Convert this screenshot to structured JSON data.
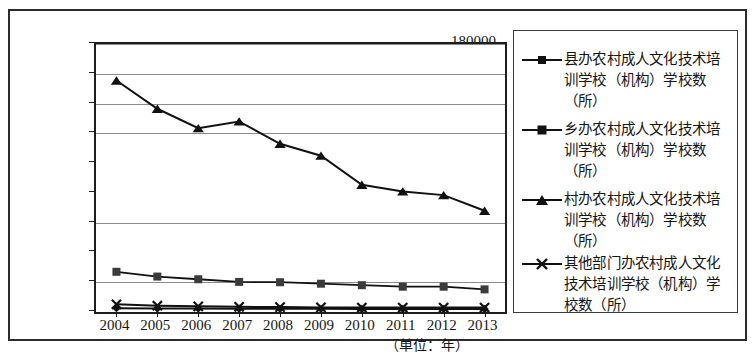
{
  "chart_data": {
    "type": "line",
    "title": "",
    "xlabel": "（单位：年）",
    "ylabel": "",
    "categories": [
      "2004",
      "2005",
      "2006",
      "2007",
      "2008",
      "2009",
      "2010",
      "2011",
      "2012",
      "2013"
    ],
    "ylim": [
      0,
      180000
    ],
    "ytick_values": [
      0,
      20000,
      40000,
      60000,
      80000,
      100000,
      120000,
      140000,
      160000,
      180000
    ],
    "ytick_labels": [
      "0",
      "20000",
      "40000",
      "60000",
      "80000",
      "100000",
      "120000",
      "140000",
      "160000",
      "180000"
    ],
    "gridline_values": [
      20000,
      60000,
      120000,
      140000,
      160000,
      180000
    ],
    "grid": true,
    "legend_position": "right",
    "series": [
      {
        "name": "县办农村成人文化技术培训学校（机构）学校数（所）",
        "marker": "diamond",
        "values": [
          null,
          null,
          null,
          null,
          null,
          null,
          null,
          null,
          null,
          null
        ]
      },
      {
        "name": "乡办农村成人文化技术培训学校（机构）学校数（所）",
        "marker": "square",
        "values": [
          27000,
          23800,
          22000,
          20200,
          20000,
          19000,
          18000,
          17000,
          17000,
          15200
        ]
      },
      {
        "name": "村办农村成人文化技术培训学校（机构）学校数（所）",
        "marker": "triangle",
        "values": [
          155500,
          136500,
          123500,
          128000,
          113000,
          105000,
          85500,
          81000,
          78500,
          68000
        ]
      },
      {
        "name": "其他部门办农村成人文化技术培训学校（机构）学校数（所）",
        "marker": "cross",
        "values": [
          5200,
          4200,
          3800,
          3500,
          3300,
          3100,
          3000,
          3000,
          3000,
          3000
        ]
      }
    ],
    "low_series_extra": {
      "name": "县办农村成人文化技术培训学校（机构）学校数（所）",
      "marker": "diamond",
      "values": [
        2600,
        2400,
        2300,
        2200,
        2100,
        2100,
        2000,
        2000,
        2000,
        2000
      ]
    }
  },
  "legend": {
    "entries": [
      {
        "marker": "diamond",
        "label": "县办农村成人文化技术培训学校（机构）学校数（所）"
      },
      {
        "marker": "square",
        "label": "乡办农村成人文化技术培训学校（机构）学校数（所）"
      },
      {
        "marker": "triangle",
        "label": "村办农村成人文化技术培训学校（机构）学校数（所）"
      },
      {
        "marker": "cross",
        "label": "其他部门办农村成人文化技术培训学校（机构）学校数（所）"
      }
    ]
  },
  "axis": {
    "x_unit_label": "（单位：年）"
  },
  "colors": {
    "line": "#111111",
    "grid": "#8c8c8c",
    "frame": "#1d1d1d",
    "outer_frame": "#2b2b2b",
    "text": "#161616"
  }
}
